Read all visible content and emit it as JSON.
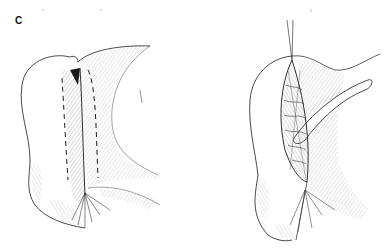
{
  "figure": {
    "panel_label": "C",
    "drawings": [
      {
        "name": "left-illustration",
        "description": "Surgical line drawing with dashed incision lines along a tissue fold"
      },
      {
        "name": "right-illustration",
        "description": "Surgical line drawing showing sutured closure with retracted flap and suture threads"
      }
    ],
    "colors": {
      "ink": "#1a1a1a",
      "hatch": "#555555",
      "background": "#ffffff"
    }
  }
}
